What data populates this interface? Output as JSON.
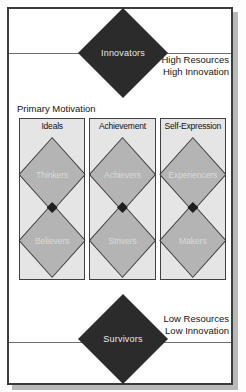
{
  "figure": {
    "top": {
      "diamond_label": "Innovators",
      "side_label_line1": "High Resources",
      "side_label_line2": "High Innovation"
    },
    "motivation": {
      "title": "Primary Motivation",
      "columns": [
        {
          "header": "Ideals",
          "upper": "Thinkers",
          "lower": "Believers"
        },
        {
          "header": "Achievement",
          "upper": "Achievers",
          "lower": "Strivers"
        },
        {
          "header": "Self-Expression",
          "upper": "Experiencers",
          "lower": "Makers"
        }
      ]
    },
    "bottom": {
      "diamond_label": "Survivors",
      "side_label_line1": "Low Resources",
      "side_label_line2": "Low Innovation"
    },
    "colors": {
      "diamond_black": "#2b2b2b",
      "diamond_gray": "#b4b4b4",
      "box_fill": "#e5e5e5",
      "frame_border": "#3b3b3b",
      "shadow": "#b9b9b9"
    }
  }
}
